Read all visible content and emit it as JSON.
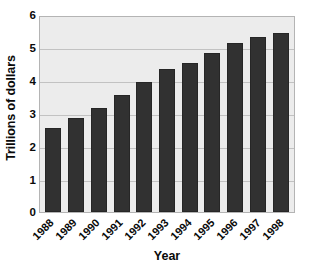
{
  "chart_data": {
    "type": "bar",
    "title": "",
    "xlabel": "Year",
    "ylabel": "Trillions of dollars",
    "categories": [
      "1988",
      "1989",
      "1990",
      "1991",
      "1992",
      "1993",
      "1994",
      "1995",
      "1996",
      "1997",
      "1998"
    ],
    "values": [
      2.6,
      2.9,
      3.2,
      3.6,
      4.0,
      4.4,
      4.6,
      4.9,
      5.2,
      5.4,
      5.5
    ],
    "ylim": [
      0,
      6
    ],
    "yticks": [
      "0",
      "1",
      "2",
      "3",
      "4",
      "5",
      "6"
    ],
    "ytick_values": [
      0,
      1,
      2,
      3,
      4,
      5,
      6
    ],
    "grid": true,
    "legend": "none",
    "bar_color": "#313131",
    "plot_background": "#ececec",
    "gridline_color": "#c2c2c2",
    "axis_color": "#b4b4b4",
    "text_color": "#0a0a0a"
  }
}
